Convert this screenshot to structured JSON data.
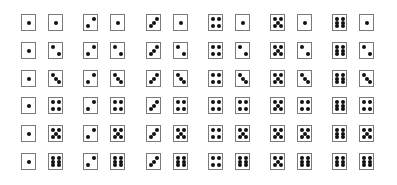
{
  "figure": {
    "rows": 6,
    "cols": 6,
    "colors": {
      "border": "#7a7a7a",
      "pip": "#111111",
      "background": "#ffffff"
    },
    "pairs": [
      [
        [
          1,
          1
        ],
        [
          2,
          1
        ],
        [
          3,
          1
        ],
        [
          4,
          1
        ],
        [
          5,
          1
        ],
        [
          6,
          1
        ]
      ],
      [
        [
          1,
          2
        ],
        [
          2,
          2
        ],
        [
          3,
          2
        ],
        [
          4,
          2
        ],
        [
          5,
          2
        ],
        [
          6,
          2
        ]
      ],
      [
        [
          1,
          3
        ],
        [
          2,
          3
        ],
        [
          3,
          3
        ],
        [
          4,
          3
        ],
        [
          5,
          3
        ],
        [
          6,
          3
        ]
      ],
      [
        [
          1,
          4
        ],
        [
          2,
          4
        ],
        [
          3,
          4
        ],
        [
          4,
          4
        ],
        [
          5,
          4
        ],
        [
          6,
          4
        ]
      ],
      [
        [
          1,
          5
        ],
        [
          2,
          5
        ],
        [
          3,
          5
        ],
        [
          4,
          5
        ],
        [
          5,
          5
        ],
        [
          6,
          5
        ]
      ],
      [
        [
          1,
          6
        ],
        [
          2,
          6
        ],
        [
          3,
          6
        ],
        [
          4,
          6
        ],
        [
          5,
          6
        ],
        [
          6,
          6
        ]
      ]
    ]
  },
  "layout": {
    "col_left": [
      21,
      83,
      146,
      208,
      270,
      332
    ],
    "pair_offset": 27,
    "row_top": [
      14,
      42,
      70,
      97,
      125,
      153
    ]
  }
}
